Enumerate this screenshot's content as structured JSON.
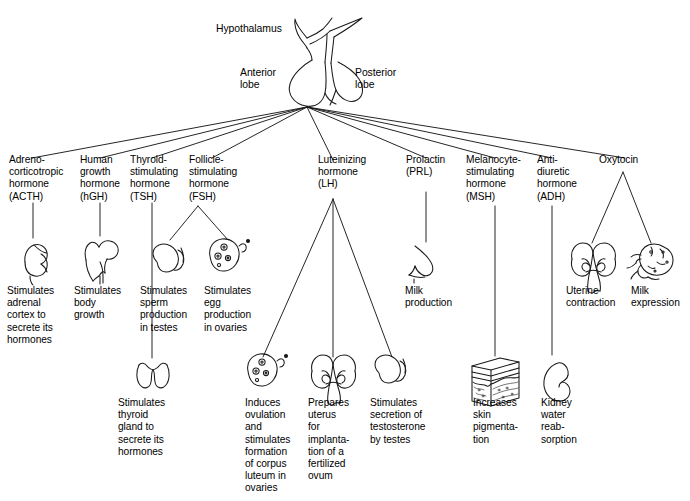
{
  "diagram": {
    "source_gland": {
      "hypothalamus_label": "Hypothalamus",
      "anterior_label": "Anterior\nlobe",
      "posterior_label": "Posterior\nlobe"
    },
    "hormones": [
      {
        "id": "acth",
        "label": "Adreno-\ncorticotropic\nhormone\n(ACTH)",
        "lobe": "anterior",
        "effects": [
          {
            "id": "acth-effect",
            "icon": "adrenal-gland-icon",
            "text": "Stimulates\nadrenal\ncortex to\nsecrete its\nhormones"
          }
        ]
      },
      {
        "id": "hgh",
        "label": "Human\ngrowth\nhormone\n(hGH)",
        "lobe": "anterior",
        "effects": [
          {
            "id": "hgh-effect",
            "icon": "femur-bone-icon",
            "text": "Stimulates\nbody\ngrowth"
          }
        ]
      },
      {
        "id": "tsh",
        "label": "Thyroid-\nstimulating\nhormone\n(TSH)",
        "lobe": "anterior",
        "effects": [
          {
            "id": "tsh-effect",
            "icon": "thyroid-gland-icon",
            "text": "Stimulates\nthyroid\ngland to\nsecrete its\nhormones"
          }
        ]
      },
      {
        "id": "fsh",
        "label": "Follicle-\nstimulating\nhormone\n(FSH)",
        "lobe": "anterior",
        "effects": [
          {
            "id": "fsh-effect-testes",
            "icon": "testis-icon",
            "text": "Stimulates\nsperm\nproduction\nin testes"
          },
          {
            "id": "fsh-effect-ovaries",
            "icon": "ovary-icon",
            "text": "Stimulates\negg\nproduction\nin ovaries"
          }
        ]
      },
      {
        "id": "lh",
        "label": "Luteinizing\nhormone\n(LH)",
        "lobe": "anterior",
        "effects": [
          {
            "id": "lh-effect-ovulation",
            "icon": "ovary-icon",
            "text": "Induces\novulation\nand\nstimulates\nformation\nof corpus\nluteum in\novaries"
          },
          {
            "id": "lh-effect-uterus",
            "icon": "uterus-icon",
            "text": "Prepares\nuterus\nfor\nimplanta-\ntion of a\nfertilized\novum"
          },
          {
            "id": "lh-effect-testosterone",
            "icon": "testis-icon",
            "text": "Stimulates\nsecretion of\ntestosterone\nby testes"
          }
        ]
      },
      {
        "id": "prl",
        "label": "Prolactin\n(PRL)",
        "lobe": "anterior",
        "effects": [
          {
            "id": "prl-effect",
            "icon": "breast-icon",
            "text": "Milk\nproduction"
          }
        ]
      },
      {
        "id": "msh",
        "label": "Melanocyte-\nstimulating\nhormone\n(MSH)",
        "lobe": "anterior",
        "effects": [
          {
            "id": "msh-effect",
            "icon": "skin-section-icon",
            "text": "Increases\nskin\npigmenta-\ntion"
          }
        ]
      },
      {
        "id": "adh",
        "label": "Anti-\ndiuretic\nhormone\n(ADH)",
        "lobe": "posterior",
        "effects": [
          {
            "id": "adh-effect",
            "icon": "kidney-icon",
            "text": "Kidney\nwater\nreab-\nsorption"
          }
        ]
      },
      {
        "id": "oxytocin",
        "label": "Oxytocin",
        "lobe": "posterior",
        "effects": [
          {
            "id": "oxytocin-effect-uterus",
            "icon": "uterus-icon",
            "text": "Uterine\ncontraction"
          },
          {
            "id": "oxytocin-effect-milk",
            "icon": "nursing-infant-icon",
            "text": "Milk\nexpression"
          }
        ]
      }
    ],
    "colors": {
      "line": "#1a1a1a",
      "text": "#000000",
      "background": "#ffffff"
    }
  }
}
